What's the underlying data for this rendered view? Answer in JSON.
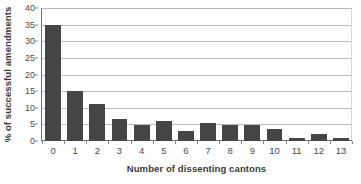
{
  "chart_data": {
    "type": "bar",
    "title": "",
    "xlabel": "Number of dissenting cantons",
    "ylabel": "% of successful amendments",
    "categories": [
      "0",
      "1",
      "2",
      "3",
      "4",
      "5",
      "6",
      "7",
      "8",
      "9",
      "10",
      "11",
      "12",
      "13"
    ],
    "values": [
      35.0,
      15.0,
      11.0,
      6.7,
      4.7,
      5.9,
      2.9,
      5.4,
      4.7,
      4.8,
      3.5,
      0.8,
      2.2,
      0.8
    ],
    "ylim": [
      0,
      40
    ],
    "ytick_labels": [
      "0",
      "5",
      "10",
      "15",
      "20",
      "25",
      "30",
      "35",
      "40"
    ],
    "ytick_values": [
      0,
      5,
      10,
      15,
      20,
      25,
      30,
      35,
      40
    ],
    "grid": "horizontal",
    "legend": "none",
    "bar_color": "#454545",
    "grid_color": "#bdbdbd",
    "axis_color": "#6f6f6f",
    "background": "#ffffff"
  }
}
